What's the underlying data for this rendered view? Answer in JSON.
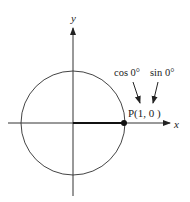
{
  "diagram": {
    "axes": {
      "x_label": "x",
      "y_label": "y"
    },
    "point_label": "P(1, 0 )",
    "annotations": {
      "cos": "cos 0°",
      "sin": "sin 0°"
    },
    "colors": {
      "ink": "#222222",
      "background": "#ffffff"
    }
  }
}
